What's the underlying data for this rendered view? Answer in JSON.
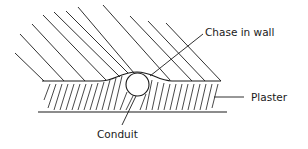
{
  "diagram": {
    "labels": {
      "chase": "Chase in wall",
      "plaster": "Plaster",
      "conduit": "Conduit"
    },
    "colors": {
      "stroke": "#1a1a1a",
      "background": "#ffffff"
    }
  }
}
